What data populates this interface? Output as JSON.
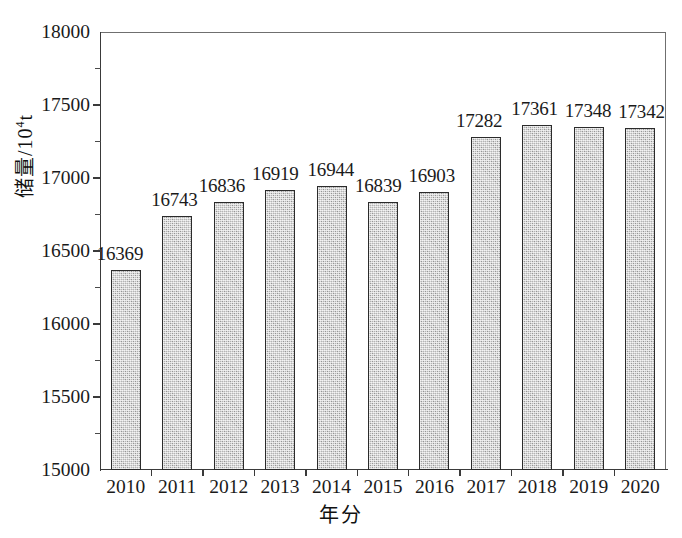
{
  "chart_data": {
    "type": "bar",
    "title": "",
    "subtitle": "",
    "xlabel": "年分",
    "ylabel": "储量/10⁴t",
    "categories": [
      "2010",
      "2011",
      "2012",
      "2013",
      "2014",
      "2015",
      "2016",
      "2017",
      "2018",
      "2019",
      "2020"
    ],
    "values": [
      16369,
      16743,
      16836,
      16919,
      16944,
      16839,
      16903,
      17282,
      17361,
      17348,
      17342
    ],
    "data_labels": [
      "16369",
      "16743",
      "16836",
      "16919",
      "16944",
      "16839",
      "16903",
      "17282",
      "17361",
      "17348",
      "17342"
    ],
    "ylim": [
      15000,
      18000
    ],
    "y_ticks": [
      15000,
      15500,
      16000,
      16500,
      17000,
      17500,
      18000
    ],
    "y_tick_labels": [
      "15000",
      "15500",
      "16000",
      "16500",
      "17000",
      "17500",
      "18000"
    ],
    "y_minor_tick_interval": 250,
    "grid": false,
    "legend": null,
    "legend_position": "none",
    "bar_fill_color": "#b4b4b4",
    "bar_edge_color": "#2b2b2b",
    "axis_color": "#3a3a3a",
    "frame_color": "#6f6f6f",
    "background_color": "#ffffff"
  },
  "axes": {
    "y_title_main": "储量/10",
    "y_title_exponent": "4",
    "y_title_unit": "t",
    "x_title": "年分"
  }
}
